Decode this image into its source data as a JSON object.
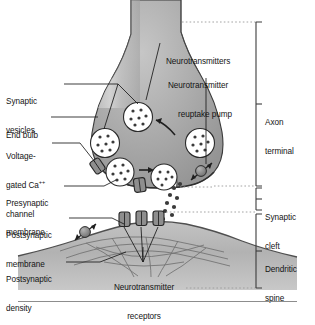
{
  "figure": {
    "domain": "Diagram"
  },
  "labels_left": [
    {
      "id": "synaptic-vesicles",
      "line1": "Synaptic",
      "line2": "vesicles"
    },
    {
      "id": "end-bulb",
      "line1": "End bulb",
      "line2": ""
    },
    {
      "id": "voltage-gated-ca-channel",
      "line1": "Voltage-",
      "line2": "gated Ca",
      "line2_sup": "++",
      "line3": "channel"
    },
    {
      "id": "presynaptic-membrane",
      "line1": "Presynaptic",
      "line2": "membrane"
    },
    {
      "id": "postsynaptic-membrane",
      "line1": "Postsynaptic",
      "line2": "membrane"
    },
    {
      "id": "postsynaptic-density",
      "line1": "Postsynaptic",
      "line2": "density"
    }
  ],
  "labels_top": [
    {
      "id": "neurotransmitters",
      "line1": "Neurotransmitters",
      "line2": ""
    },
    {
      "id": "neurotransmitter-reuptake-pump",
      "line1": "Neurotransmitter",
      "line2": "reuptake pump"
    }
  ],
  "labels_bottom": [
    {
      "id": "neurotransmitter-receptors",
      "line1": "Neurotransmitter",
      "line2": "receptors"
    }
  ],
  "brackets": [
    {
      "id": "axon-terminal",
      "line1": "Axon",
      "line2": "terminal"
    },
    {
      "id": "synaptic-cleft",
      "line1": "Synaptic",
      "line2": "cleft"
    },
    {
      "id": "dendritic-spine",
      "line1": "Dendritic",
      "line2": "spine"
    }
  ],
  "colors": {
    "background": "#ffffff",
    "terminal_fill": "#a9a9a9",
    "terminal_fill_light": "#c9c9c9",
    "terminal_stroke": "#3a3a3a",
    "vesicle_fill": "#ffffff",
    "vesicle_stroke": "#2b2b2b",
    "transmitter_dot": "#3a3a3a",
    "channel_fill": "#8e8e8e",
    "channel_stroke": "#262626",
    "pump_fill": "#8a8a8a",
    "spine_fill": "#b8b8b8",
    "density_line": "#6a6a6a",
    "leader_line": "#1a1a1a",
    "bracket_line": "#3c3c3c",
    "dotted_guide": "#9a9a9a",
    "rule": "#8d8d8d"
  },
  "counts": {
    "vesicles": 5,
    "vesicle_dots_each": 7,
    "presynaptic_channels": 2,
    "postsynaptic_receptors": 3,
    "reuptake_pumps": 2,
    "cleft_transmitter_dots": 9
  }
}
